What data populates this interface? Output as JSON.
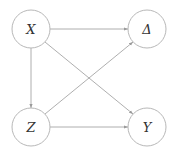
{
  "diagram": {
    "type": "directed-graph",
    "nodes": [
      {
        "id": "X",
        "label": "X",
        "cx": 31,
        "cy": 29,
        "r": 19
      },
      {
        "id": "D",
        "label": "Δ",
        "cx": 147,
        "cy": 29,
        "r": 19
      },
      {
        "id": "Z",
        "label": "Z",
        "cx": 31,
        "cy": 127,
        "r": 19
      },
      {
        "id": "Y",
        "label": "Y",
        "cx": 147,
        "cy": 127,
        "r": 19
      }
    ],
    "edges": [
      {
        "from": "X",
        "to": "D"
      },
      {
        "from": "X",
        "to": "Z"
      },
      {
        "from": "X",
        "to": "Y"
      },
      {
        "from": "Z",
        "to": "D"
      },
      {
        "from": "Z",
        "to": "Y"
      }
    ],
    "colors": {
      "node_stroke": "#b8b8b8",
      "edge": "#9a9a9a",
      "label": "#333333"
    }
  }
}
